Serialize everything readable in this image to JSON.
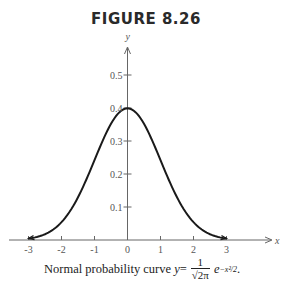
{
  "figure": {
    "title": "FIGURE 8.26",
    "caption_prefix": "Normal probability curve ",
    "caption_y": "y",
    "caption_eq": " = ",
    "caption_num": "1",
    "caption_den": "√2π",
    "caption_e": "e",
    "caption_exp": "−x²/2",
    "caption_end": "."
  },
  "chart_data": {
    "type": "line",
    "title": "FIGURE 8.26",
    "subtitle": "Normal probability curve y = 1/√(2π) e^(−x²/2).",
    "xlabel": "x",
    "ylabel": "y",
    "xlim": [
      -3,
      3
    ],
    "ylim": [
      0,
      0.5
    ],
    "x_ticks": [
      -3,
      -2,
      -1,
      0,
      1,
      2,
      3
    ],
    "x_tick_labels": [
      "-3",
      "-2",
      "-1",
      "0",
      "1",
      "2",
      "3"
    ],
    "y_ticks": [
      0.1,
      0.2,
      0.3,
      0.4,
      0.5
    ],
    "y_tick_labels": [
      "0.1",
      "0.2",
      "0.3",
      "0.4",
      "0.5"
    ],
    "grid": false,
    "legend": null,
    "series": [
      {
        "name": "standard normal density",
        "x": [
          -3,
          -2.5,
          -2,
          -1.5,
          -1,
          -0.5,
          0,
          0.5,
          1,
          1.5,
          2,
          2.5,
          3
        ],
        "values": [
          0.0044,
          0.0175,
          0.054,
          0.1295,
          0.242,
          0.3521,
          0.3989,
          0.3521,
          0.242,
          0.1295,
          0.054,
          0.0175,
          0.0044
        ]
      }
    ]
  }
}
